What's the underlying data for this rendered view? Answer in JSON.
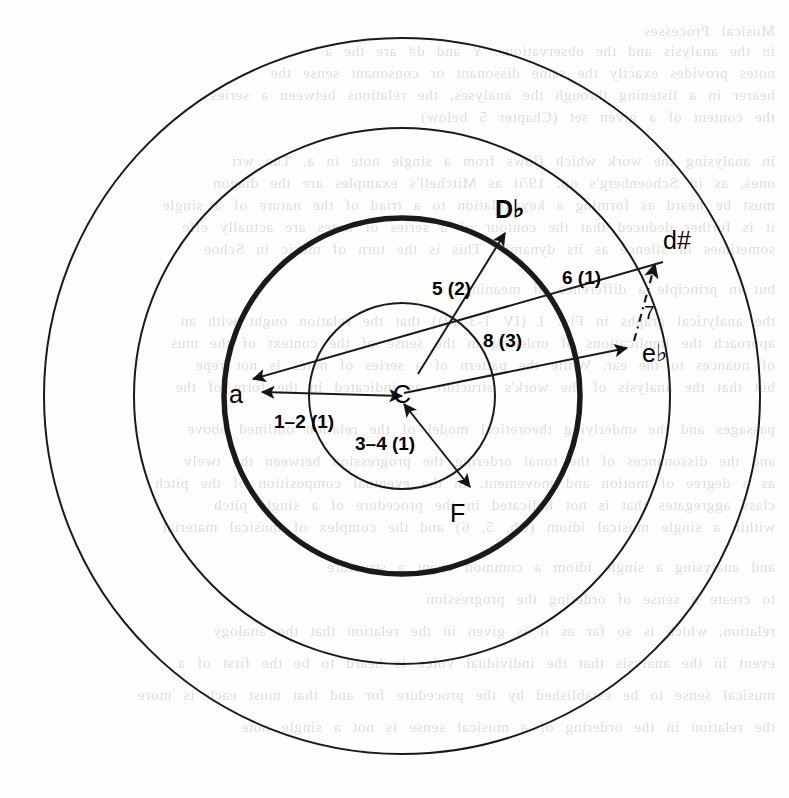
{
  "figure": {
    "width": 789,
    "height": 798,
    "center": {
      "x": 402,
      "y": 396
    },
    "stroke_color": "#1a1a1a",
    "background_color": "#fefefd"
  },
  "circles": [
    {
      "name": "outer-circle",
      "radius": 358,
      "stroke_width": 2.0,
      "emphasis": "normal"
    },
    {
      "name": "second-circle",
      "radius": 268,
      "stroke_width": 2.0,
      "emphasis": "normal"
    },
    {
      "name": "bold-circle",
      "radius": 178,
      "stroke_width": 5.5,
      "emphasis": "bold"
    },
    {
      "name": "inner-circle",
      "radius": 93,
      "stroke_width": 2.0,
      "emphasis": "normal"
    }
  ],
  "nodes": [
    {
      "id": "a",
      "label": "a",
      "accidental": "",
      "bold": false,
      "x": 238,
      "y": 396
    },
    {
      "id": "C",
      "label": "C",
      "accidental": "",
      "bold": false,
      "x": 402,
      "y": 396
    },
    {
      "id": "Db",
      "label": "D",
      "accidental": "♭",
      "bold": true,
      "x": 504,
      "y": 211
    },
    {
      "id": "dsharp",
      "label": "d#",
      "accidental": "",
      "bold": false,
      "x": 672,
      "y": 242
    },
    {
      "id": "eb",
      "label": "e",
      "accidental": "♭",
      "bold": false,
      "x": 651,
      "y": 355
    },
    {
      "id": "F",
      "label": "F",
      "accidental": "",
      "bold": false,
      "x": 459,
      "y": 515
    }
  ],
  "edges": [
    {
      "id": "edge-1-2",
      "label": "1–2 (1)",
      "label_x": 274,
      "label_y": 411,
      "from": "C",
      "to": "a",
      "arrow": "double",
      "style": "solid"
    },
    {
      "id": "edge-3-4",
      "label": "3–4 (1)",
      "label_x": 355,
      "label_y": 433,
      "from": "C",
      "to": "F",
      "arrow": "double",
      "style": "solid"
    },
    {
      "id": "edge-5",
      "label": "5 (2)",
      "label_x": 432,
      "label_y": 278,
      "from": "C",
      "to": "Db",
      "arrow": "single",
      "style": "solid"
    },
    {
      "id": "edge-6",
      "label": "6 (1)",
      "label_x": 562,
      "label_y": 267,
      "from": "C",
      "to": "eb",
      "arrow": "single",
      "style": "solid"
    },
    {
      "id": "edge-7",
      "label": "7",
      "label_x": 644,
      "label_y": 302,
      "from": "eb",
      "to": "dsharp",
      "arrow": "single",
      "style": "dash-dot"
    },
    {
      "id": "edge-8",
      "label": "8 (3)",
      "label_x": 483,
      "label_y": 330,
      "from": "dsharp",
      "to": "a",
      "arrow": "single",
      "style": "solid"
    }
  ],
  "background_text": [
    {
      "y": 22,
      "text": "Musical Processes"
    },
    {
      "y": 42,
      "text": "in the analysis and the observations. Y and d# are the a"
    },
    {
      "y": 64,
      "text": "notes provides exactly the same dissonant or consonant sense the"
    },
    {
      "y": 86,
      "text": "hearer in a listening through the analyses, the relations between a series"
    },
    {
      "y": 108,
      "text": "the content of a given set (Chapter 5 below)"
    },
    {
      "y": 152,
      "text": "in analysing the work which flows from a single note in a. The wri"
    },
    {
      "y": 174,
      "text": "ones, as in Schoenberg's op. 19/ii as Mitchell's examples are the diagon"
    },
    {
      "y": 196,
      "text": "must be heard as forming a key relation to a triad of the nature of a single"
    },
    {
      "y": 218,
      "text": "it is further deduced that the contour of a series of notes are actually effe"
    },
    {
      "y": 240,
      "text": "sometimes in silence as its dynamic. This is the turn of music in Schoe"
    },
    {
      "y": 280,
      "text": "but in principle a difference of meaning."
    },
    {
      "y": 312,
      "text": "the analytical graphs in Fig. 1 (IV 1-3 (2)) that the relation ought with an"
    },
    {
      "y": 334,
      "text": "approach the implications of ordering in the sense of the context of the mus"
    },
    {
      "y": 356,
      "text": "of nuances to the ear. While the pattern of a series of notes is not repe"
    },
    {
      "y": 378,
      "text": "but that the analysis of the work's structure as indicated in the form of the"
    },
    {
      "y": 420,
      "text": "passages and the underlying theoretical model of the relation outlined above"
    },
    {
      "y": 452,
      "text": "and the dissonances of the tonal ordering the progression between the twelv"
    },
    {
      "y": 474,
      "text": "as a degree of motion and movement. In the eventual composition of the pitch"
    },
    {
      "y": 496,
      "text": "class aggregates that is not indicated in the procedure of a single pitch"
    },
    {
      "y": 518,
      "text": "within a single musical idiom (Ch. 5, 6) and the complex of musical material"
    },
    {
      "y": 558,
      "text": "and analysing a single idiom a common event a structure"
    },
    {
      "y": 590,
      "text": "to create a sense of ordering the progression"
    },
    {
      "y": 622,
      "text": "relation, which is so far as it is given in the relation that the analogy"
    },
    {
      "y": 654,
      "text": "event in the analysis that the individual voice is heard to be the first of a"
    },
    {
      "y": 686,
      "text": "musical sense to be established by the procedure for and that must each is more"
    },
    {
      "y": 718,
      "text": "the relation in the ordering of a musical sense is not a single note"
    }
  ]
}
